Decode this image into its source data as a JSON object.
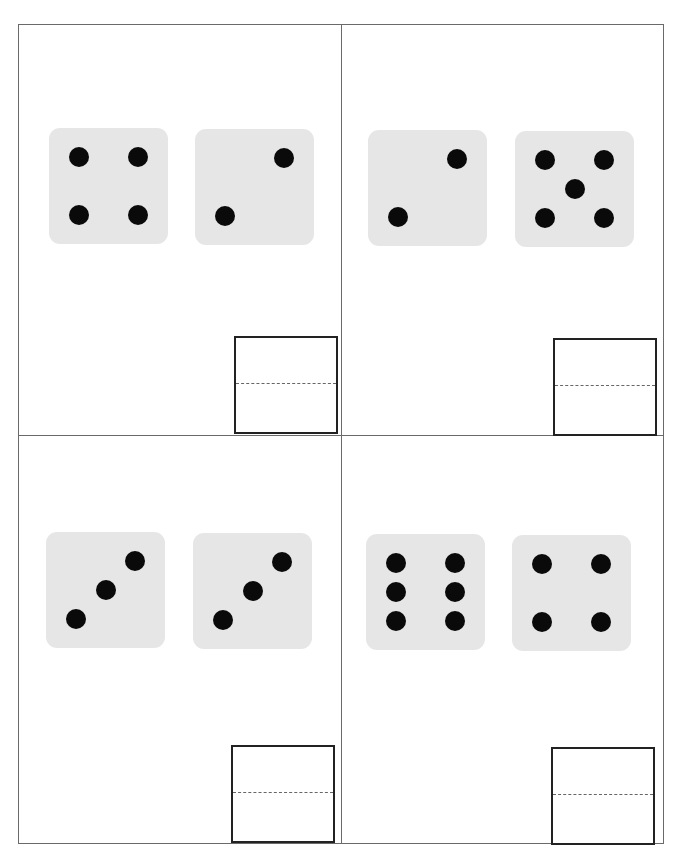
{
  "worksheet": {
    "type": "dice addition worksheet",
    "cards": [
      {
        "dice": [
          4,
          2
        ],
        "answer": ""
      },
      {
        "dice": [
          2,
          5
        ],
        "answer": ""
      },
      {
        "dice": [
          3,
          3
        ],
        "answer": ""
      },
      {
        "dice": [
          6,
          4
        ],
        "answer": ""
      }
    ]
  },
  "colors": {
    "die_face": "#e6e6e6",
    "pip": "#0a0a0a",
    "grid_line": "#6a6a6a",
    "answer_border": "#222222"
  }
}
